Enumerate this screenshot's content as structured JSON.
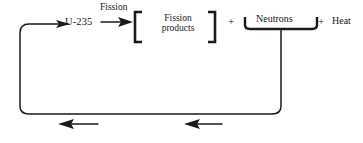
{
  "diagram": {
    "background_color": "#ffffff",
    "stroke_color": "#1a1a1a",
    "text_color": "#1a1a1a",
    "labels": {
      "process_arrow": "Fission",
      "reactant": "U-235",
      "products_line1": "Fission",
      "products_line2": "products",
      "plus_1": "+",
      "neutrons": "Neutrons",
      "plus_2": "+",
      "heat": "Heat"
    },
    "feedback_loop": {
      "description": "Neutrons recycle back to U-235",
      "direction": "right-to-left along bottom, then up and right into U-235",
      "arrow_count": 2
    }
  }
}
